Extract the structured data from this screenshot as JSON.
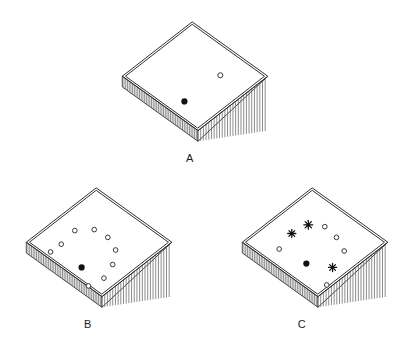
{
  "figure": {
    "background": "#ffffff",
    "stroke": "#2b2b2b",
    "hatch_color": "#555555",
    "top_face_fill": "#ffffff"
  },
  "panels": [
    {
      "id": "A",
      "label": "A",
      "label_x": 190,
      "label_y": 152,
      "origin_x": 118,
      "origin_y": 18,
      "markers": [
        {
          "type": "filled-dot",
          "x": 64,
          "y": 82,
          "r": 3.2
        },
        {
          "type": "open-circle",
          "x": 101,
          "y": 55,
          "r": 2.6
        }
      ]
    },
    {
      "id": "B",
      "label": "B",
      "label_x": 88,
      "label_y": 318,
      "origin_x": 22,
      "origin_y": 184,
      "markers": [
        {
          "type": "filled-dot",
          "x": 57,
          "y": 82,
          "r": 3.2
        },
        {
          "type": "open-circle",
          "x": 36,
          "y": 58,
          "r": 2.4
        },
        {
          "type": "open-circle",
          "x": 50,
          "y": 44,
          "r": 2.4
        },
        {
          "type": "open-circle",
          "x": 70,
          "y": 43,
          "r": 2.4
        },
        {
          "type": "open-circle",
          "x": 84,
          "y": 51,
          "r": 2.4
        },
        {
          "type": "open-circle",
          "x": 92,
          "y": 64,
          "r": 2.4
        },
        {
          "type": "open-circle",
          "x": 89,
          "y": 79,
          "r": 2.4
        },
        {
          "type": "open-circle",
          "x": 80,
          "y": 93,
          "r": 2.4
        },
        {
          "type": "open-circle",
          "x": 64,
          "y": 101,
          "r": 2.4
        },
        {
          "type": "open-circle",
          "x": 25,
          "y": 66,
          "r": 2.4
        }
      ]
    },
    {
      "id": "C",
      "label": "C",
      "label_x": 302,
      "label_y": 318,
      "origin_x": 238,
      "origin_y": 184,
      "markers": [
        {
          "type": "filled-dot",
          "x": 66,
          "y": 78,
          "r": 3.2
        },
        {
          "type": "asterisk",
          "x": 68,
          "y": 38,
          "r": 4.6
        },
        {
          "type": "asterisk",
          "x": 51,
          "y": 47,
          "r": 4.2
        },
        {
          "type": "asterisk",
          "x": 93,
          "y": 82,
          "r": 4.2
        },
        {
          "type": "open-circle",
          "x": 85,
          "y": 40,
          "r": 2.4
        },
        {
          "type": "open-circle",
          "x": 97,
          "y": 51,
          "r": 2.4
        },
        {
          "type": "open-circle",
          "x": 105,
          "y": 65,
          "r": 2.4
        },
        {
          "type": "open-circle",
          "x": 38,
          "y": 63,
          "r": 2.4
        },
        {
          "type": "open-circle",
          "x": 87,
          "y": 100,
          "r": 2.4
        }
      ]
    }
  ]
}
